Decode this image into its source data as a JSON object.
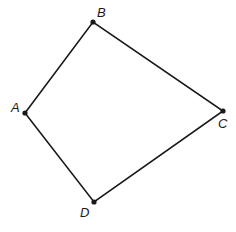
{
  "diagram": {
    "type": "quadrilateral",
    "vertices": [
      {
        "id": "A",
        "label": "A",
        "x": 25,
        "y": 113,
        "lx": 11,
        "ly": 112
      },
      {
        "id": "B",
        "label": "B",
        "x": 93,
        "y": 22,
        "lx": 97,
        "ly": 17
      },
      {
        "id": "C",
        "label": "C",
        "x": 223,
        "y": 111,
        "lx": 218,
        "ly": 128
      },
      {
        "id": "D",
        "label": "D",
        "x": 94,
        "y": 202,
        "lx": 80,
        "ly": 217
      }
    ],
    "edges": [
      [
        "A",
        "B"
      ],
      [
        "B",
        "C"
      ],
      [
        "C",
        "D"
      ],
      [
        "D",
        "A"
      ]
    ],
    "stroke_color": "#1a1a1a"
  }
}
